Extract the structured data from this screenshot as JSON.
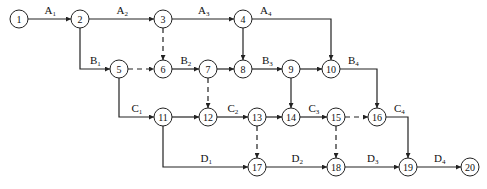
{
  "diagram": {
    "type": "activity-on-arrow network (double-code network diagram)",
    "nodes": [
      {
        "id": "1",
        "x": 19,
        "y": 19
      },
      {
        "id": "2",
        "x": 80,
        "y": 19
      },
      {
        "id": "3",
        "x": 163,
        "y": 19
      },
      {
        "id": "4",
        "x": 243,
        "y": 19
      },
      {
        "id": "5",
        "x": 119,
        "y": 69
      },
      {
        "id": "6",
        "x": 163,
        "y": 69
      },
      {
        "id": "7",
        "x": 208,
        "y": 69
      },
      {
        "id": "8",
        "x": 243,
        "y": 69
      },
      {
        "id": "9",
        "x": 291,
        "y": 69
      },
      {
        "id": "10",
        "x": 331,
        "y": 69
      },
      {
        "id": "11",
        "x": 163,
        "y": 117
      },
      {
        "id": "12",
        "x": 208,
        "y": 117
      },
      {
        "id": "13",
        "x": 257,
        "y": 117
      },
      {
        "id": "14",
        "x": 291,
        "y": 117
      },
      {
        "id": "15",
        "x": 336,
        "y": 117
      },
      {
        "id": "16",
        "x": 377,
        "y": 117
      },
      {
        "id": "17",
        "x": 257,
        "y": 167
      },
      {
        "id": "18",
        "x": 336,
        "y": 167
      },
      {
        "id": "19",
        "x": 408,
        "y": 167
      },
      {
        "id": "20",
        "x": 470,
        "y": 167
      }
    ],
    "edges": [
      {
        "from": "1",
        "to": "2",
        "label": "A",
        "sub": "1",
        "style": "solid"
      },
      {
        "from": "2",
        "to": "3",
        "label": "A",
        "sub": "2",
        "style": "solid"
      },
      {
        "from": "3",
        "to": "4",
        "label": "A",
        "sub": "3",
        "style": "solid"
      },
      {
        "from": "4",
        "to": "10",
        "label": "A",
        "sub": "4",
        "style": "solid"
      },
      {
        "from": "2",
        "to": "5",
        "label": "B",
        "sub": "1",
        "style": "solid"
      },
      {
        "from": "6",
        "to": "7",
        "label": "B",
        "sub": "2",
        "style": "solid"
      },
      {
        "from": "8",
        "to": "9",
        "label": "B",
        "sub": "3",
        "style": "solid"
      },
      {
        "from": "10",
        "to": "16",
        "label": "B",
        "sub": "4",
        "style": "solid"
      },
      {
        "from": "5",
        "to": "11",
        "label": "C",
        "sub": "1",
        "style": "solid"
      },
      {
        "from": "12",
        "to": "13",
        "label": "C",
        "sub": "2",
        "style": "solid"
      },
      {
        "from": "14",
        "to": "15",
        "label": "C",
        "sub": "3",
        "style": "solid"
      },
      {
        "from": "16",
        "to": "19",
        "label": "C",
        "sub": "4",
        "style": "solid"
      },
      {
        "from": "11",
        "to": "17",
        "label": "D",
        "sub": "1",
        "style": "solid"
      },
      {
        "from": "17",
        "to": "18",
        "label": "D",
        "sub": "2",
        "style": "solid"
      },
      {
        "from": "18",
        "to": "19",
        "label": "D",
        "sub": "3",
        "style": "solid"
      },
      {
        "from": "19",
        "to": "20",
        "label": "D",
        "sub": "4",
        "style": "solid"
      },
      {
        "from": "3",
        "to": "6",
        "label": "",
        "sub": "",
        "style": "dummy"
      },
      {
        "from": "4",
        "to": "8",
        "label": "",
        "sub": "",
        "style": "solid"
      },
      {
        "from": "5",
        "to": "6",
        "label": "",
        "sub": "",
        "style": "dummy"
      },
      {
        "from": "7",
        "to": "8",
        "label": "",
        "sub": "",
        "style": "solid"
      },
      {
        "from": "7",
        "to": "12",
        "label": "",
        "sub": "",
        "style": "dummy"
      },
      {
        "from": "9",
        "to": "10",
        "label": "",
        "sub": "",
        "style": "solid"
      },
      {
        "from": "9",
        "to": "14",
        "label": "",
        "sub": "",
        "style": "solid"
      },
      {
        "from": "11",
        "to": "12",
        "label": "",
        "sub": "",
        "style": "solid"
      },
      {
        "from": "13",
        "to": "14",
        "label": "",
        "sub": "",
        "style": "solid"
      },
      {
        "from": "13",
        "to": "17",
        "label": "",
        "sub": "",
        "style": "dummy"
      },
      {
        "from": "15",
        "to": "16",
        "label": "",
        "sub": "",
        "style": "dummy"
      },
      {
        "from": "15",
        "to": "18",
        "label": "",
        "sub": "",
        "style": "dummy"
      }
    ]
  }
}
